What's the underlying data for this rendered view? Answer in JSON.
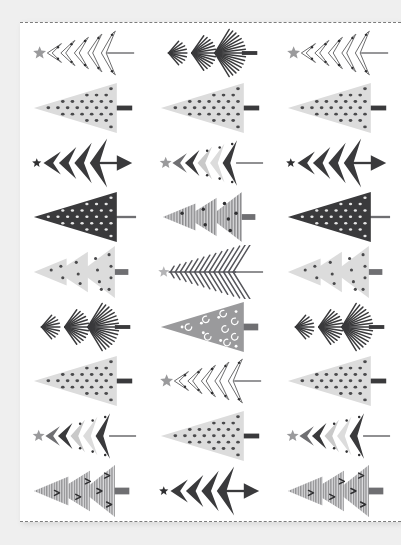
{
  "page": {
    "background_color": "#efefef",
    "sheet_color": "#ffffff",
    "cut_line_color": "#7d7d7d",
    "cut_line_style": "dashed",
    "orientation": "trees point left",
    "columns": 3,
    "rows": 9
  },
  "palette": {
    "dark": "#3a3a3c",
    "darker": "#2f2f31",
    "mid": "#6f6f72",
    "light": "#c9c9c9",
    "lighter": "#dcdcdc",
    "pale": "#e3e3e3",
    "outline": "#555557",
    "white": "#ffffff",
    "star_gray": "#9a9a9c",
    "star_dark": "#2f2f31"
  },
  "tree_styles": {
    "outline_chevron": {
      "name": "outline-chevron-tree",
      "description": "Five nested outlined chevrons with dots, gray star topper, thin straight trunk",
      "fill": "#ffffff",
      "stroke": "#555557",
      "dot_color": "#2f2f31",
      "star": "#9a9a9c",
      "trunk": "line"
    },
    "fan_stripe": {
      "name": "fan-stripe-tree",
      "description": "Three fanned tiers of radiating dark strokes, short thick trunk",
      "stroke": "#3a3a3c",
      "trunk": "bar"
    },
    "dotted_triangle_light": {
      "name": "dotted-triangle-light-tree",
      "description": "Single pale triangle filled with small dark dots, dark bar trunk",
      "fill": "#dcdcdc",
      "dot_color": "#4a4a4c",
      "trunk": "bar"
    },
    "dotted_triangle_dark": {
      "name": "dotted-triangle-dark-tree",
      "description": "Single dark triangle with small light dots, thin trunk",
      "fill": "#3a3a3c",
      "dot_color": "#e6e6e6",
      "trunk": "line"
    },
    "solid_chevron_arrow_dark": {
      "name": "solid-chevron-arrow-dark-tree",
      "description": "Four solid dark spiky chevrons, small dark star, arrow-head trunk",
      "fill": "#3a3a3c",
      "star": "#2f2f31",
      "trunk": "arrow"
    },
    "multigray_chevron": {
      "name": "multigray-chevron-tree",
      "description": "Five solid chevrons alternating gray tones with dots, gray star, line trunk",
      "fills": [
        "#6f6f72",
        "#3a3a3c",
        "#c9c9c9",
        "#dcdcdc",
        "#3a3a3c"
      ],
      "star": "#9a9a9c",
      "trunk": "line"
    },
    "hatched_layers": {
      "name": "hatched-layer-tree",
      "description": "Three overlapping vertically hatched triangle tiers with dots, bar trunk",
      "fill": "#8a8a8c",
      "dot_color": "#2f2f31",
      "trunk": "bar"
    },
    "pale_layers_dots": {
      "name": "pale-layer-dot-tree",
      "description": "Three overlapping pale triangle tiers with scattered dots and swirls, bar trunk",
      "fill": "#dcdcdc",
      "dot_color": "#4a4a4c",
      "trunk": "bar"
    },
    "feather_spine": {
      "name": "feather-spine-tree",
      "description": "Fishbone / feather of thin angled strokes along a central spine, gray star, line trunk",
      "stroke": "#55555a",
      "star": "#b4b4b6",
      "trunk": "line"
    },
    "striped_layers_arrows": {
      "name": "striped-layer-arrow-tree",
      "description": "Three striped triangle tiers with tiny arrow marks, dark bar trunk",
      "fill": "#b7b7b9",
      "stripe": "#8a8a8c",
      "mark_color": "#2f2f31",
      "trunk": "bar"
    },
    "swirl_triangle": {
      "name": "swirl-triangle-tree",
      "description": "Mid-gray triangle with white swirl and dot decorations, bar trunk",
      "fill": "#9a9a9c",
      "decor": "#ffffff",
      "trunk": "bar"
    }
  },
  "grid": [
    {
      "row": 1,
      "cells": [
        "outline_chevron",
        "fan_stripe",
        "outline_chevron"
      ]
    },
    {
      "row": 2,
      "cells": [
        "dotted_triangle_light",
        "dotted_triangle_light",
        "dotted_triangle_light"
      ]
    },
    {
      "row": 3,
      "cells": [
        "solid_chevron_arrow_dark",
        "multigray_chevron",
        "solid_chevron_arrow_dark"
      ]
    },
    {
      "row": 4,
      "cells": [
        "dotted_triangle_dark",
        "hatched_layers",
        "dotted_triangle_dark"
      ]
    },
    {
      "row": 5,
      "cells": [
        "pale_layers_dots",
        "feather_spine",
        "pale_layers_dots"
      ]
    },
    {
      "row": 6,
      "cells": [
        "fan_stripe",
        "swirl_triangle",
        "fan_stripe"
      ]
    },
    {
      "row": 7,
      "cells": [
        "dotted_triangle_light",
        "outline_chevron",
        "dotted_triangle_light"
      ]
    },
    {
      "row": 8,
      "cells": [
        "multigray_chevron",
        "dotted_triangle_light",
        "multigray_chevron"
      ]
    },
    {
      "row": 9,
      "cells": [
        "striped_layers_arrows",
        "solid_chevron_arrow_dark",
        "striped_layers_arrows"
      ]
    }
  ]
}
